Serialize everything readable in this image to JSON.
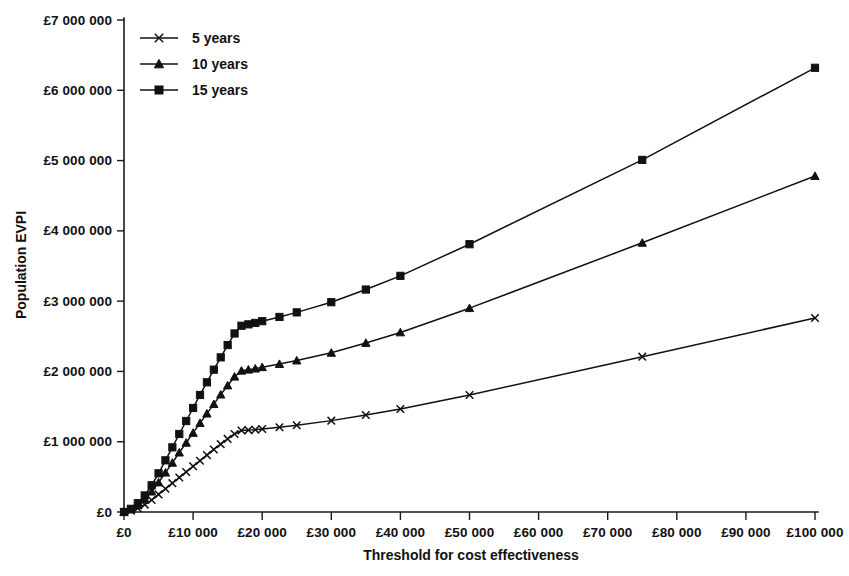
{
  "chart_data": {
    "type": "line",
    "title": "",
    "xlabel": "Threshold for cost effectiveness",
    "ylabel": "Population EVPI",
    "xlim": [
      0,
      100000
    ],
    "ylim": [
      0,
      7000000
    ],
    "grid": false,
    "legend_position": "top-left",
    "x_tick_labels": [
      "£0",
      "£10 000",
      "£20 000",
      "£30 000",
      "£40 000",
      "£50 000",
      "£60 000",
      "£70 000",
      "£80 000",
      "£90 000",
      "£100 000"
    ],
    "x_tick_values": [
      0,
      10000,
      20000,
      30000,
      40000,
      50000,
      60000,
      70000,
      80000,
      90000,
      100000
    ],
    "y_tick_labels": [
      "£0",
      "£1 000 000",
      "£2 000 000",
      "£3 000 000",
      "£4 000 000",
      "£5 000 000",
      "£6 000 000",
      "£7 000 000"
    ],
    "y_tick_values": [
      0,
      1000000,
      2000000,
      3000000,
      4000000,
      5000000,
      6000000,
      7000000
    ],
    "series": [
      {
        "name": "5 years",
        "marker": "cross",
        "x": [
          0,
          1000,
          2000,
          3000,
          4000,
          5000,
          6000,
          7000,
          8000,
          9000,
          10000,
          11000,
          12000,
          13000,
          14000,
          15000,
          16000,
          17000,
          18000,
          19000,
          20000,
          22500,
          25000,
          30000,
          35000,
          40000,
          50000,
          75000,
          100000
        ],
        "values": [
          0,
          20000,
          55000,
          105000,
          170000,
          250000,
          330000,
          410000,
          490000,
          570000,
          650000,
          730000,
          810000,
          890000,
          965000,
          1040000,
          1110000,
          1160000,
          1165000,
          1170000,
          1180000,
          1205000,
          1235000,
          1300000,
          1380000,
          1465000,
          1665000,
          2210000,
          2760000
        ]
      },
      {
        "name": "10 years",
        "marker": "triangle",
        "x": [
          0,
          1000,
          2000,
          3000,
          4000,
          5000,
          6000,
          7000,
          8000,
          9000,
          10000,
          11000,
          12000,
          13000,
          14000,
          15000,
          16000,
          17000,
          18000,
          19000,
          20000,
          22500,
          25000,
          30000,
          35000,
          40000,
          50000,
          75000,
          100000
        ],
        "values": [
          0,
          35000,
          95000,
          180000,
          290000,
          420000,
          560000,
          700000,
          845000,
          985000,
          1125000,
          1265000,
          1400000,
          1535000,
          1670000,
          1800000,
          1925000,
          2010000,
          2025000,
          2040000,
          2060000,
          2105000,
          2155000,
          2265000,
          2405000,
          2555000,
          2900000,
          3830000,
          4780000
        ]
      },
      {
        "name": "15 years",
        "marker": "square",
        "x": [
          0,
          1000,
          2000,
          3000,
          4000,
          5000,
          6000,
          7000,
          8000,
          9000,
          10000,
          11000,
          12000,
          13000,
          14000,
          15000,
          16000,
          17000,
          18000,
          19000,
          20000,
          22500,
          25000,
          30000,
          35000,
          40000,
          50000,
          75000,
          100000
        ],
        "values": [
          0,
          45000,
          125000,
          235000,
          380000,
          550000,
          735000,
          920000,
          1110000,
          1295000,
          1480000,
          1665000,
          1845000,
          2025000,
          2200000,
          2375000,
          2540000,
          2650000,
          2670000,
          2690000,
          2715000,
          2775000,
          2840000,
          2985000,
          3165000,
          3360000,
          3810000,
          5010000,
          6320000
        ]
      }
    ]
  },
  "legend": {
    "items": [
      {
        "label": "5 years",
        "marker": "cross"
      },
      {
        "label": "10 years",
        "marker": "triangle"
      },
      {
        "label": "15 years",
        "marker": "square"
      }
    ]
  },
  "colors": {
    "ink": "#111111",
    "background": "#ffffff"
  }
}
